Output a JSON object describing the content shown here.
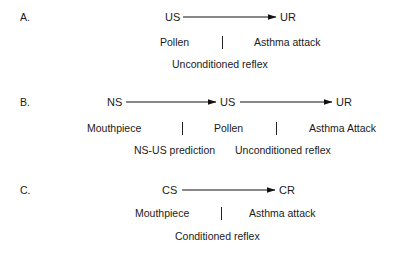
{
  "panels": [
    {
      "label": "A.",
      "chain": [
        "US",
        "UR"
      ],
      "stimuli": [
        "Pollen",
        "Asthma attack"
      ],
      "relations": [
        "Unconditioned reflex"
      ]
    },
    {
      "label": "B.",
      "chain": [
        "NS",
        "US",
        "UR"
      ],
      "stimuli": [
        "Mouthpiece",
        "Pollen",
        "Asthma Attack"
      ],
      "relations": [
        "NS-US prediction",
        "Unconditioned reflex"
      ]
    },
    {
      "label": "C.",
      "chain": [
        "CS",
        "CR"
      ],
      "stimuli": [
        "Mouthpiece",
        "Asthma attack"
      ],
      "relations": [
        "Conditioned reflex"
      ]
    }
  ],
  "colors": {
    "text": "#1a1a1a",
    "arrow": "#111111",
    "background": "#ffffff"
  }
}
